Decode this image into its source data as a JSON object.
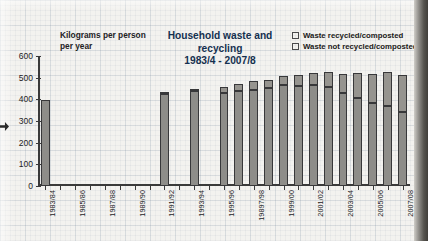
{
  "chart_data": {
    "type": "bar",
    "stacked": true,
    "title": "Household waste and recycling\n1983/4 - 2007/8",
    "title_line1": "Household waste and recycling",
    "title_line2": "1983/4 - 2007/8",
    "ylabel": "Kilograms per person per year",
    "ylabel_line1": "Kilograms per person",
    "ylabel_line2": "per year",
    "xlabel": "",
    "ylim": [
      0,
      600
    ],
    "yticks": [
      0,
      100,
      200,
      300,
      400,
      500,
      600
    ],
    "grid": true,
    "legend_position": "top-right",
    "categories": [
      "1983/84",
      "1984/85",
      "1985/86",
      "1986/87",
      "1987/88",
      "1988/89",
      "1989/90",
      "1990/91",
      "1991/92",
      "1992/93",
      "1993/94",
      "1994/95",
      "1995/96",
      "1996/97",
      "19897/98",
      "1998/99",
      "1999/00",
      "2000/01",
      "2001/02",
      "2002/03",
      "2003/04",
      "2004/05",
      "2005/06",
      "2006/07",
      "2007/08"
    ],
    "xtick_labels": [
      "1983/84",
      "1985/86",
      "1987/88",
      "1989/90",
      "1991/92",
      "1993/94",
      "1995/96",
      "19897/98",
      "1999/00",
      "2001/02",
      "2003/04",
      "2005/06",
      "2007/08"
    ],
    "series": [
      {
        "name": "Waste not recycled/composted",
        "color": "#8e8d89",
        "values": [
          397,
          null,
          null,
          null,
          null,
          null,
          null,
          null,
          424,
          null,
          437,
          null,
          427,
          440,
          443,
          452,
          464,
          463,
          464,
          455,
          428,
          408,
          384,
          367,
          343
        ]
      },
      {
        "name": "Waste recycled/composted",
        "color": "#96948f",
        "values": [
          0,
          null,
          null,
          null,
          null,
          null,
          null,
          null,
          7,
          null,
          11,
          null,
          28,
          33,
          41,
          38,
          44,
          49,
          56,
          70,
          87,
          112,
          131,
          157,
          171
        ]
      }
    ],
    "totals": [
      397,
      null,
      null,
      null,
      null,
      null,
      null,
      null,
      431,
      null,
      448,
      null,
      455,
      473,
      484,
      490,
      508,
      512,
      520,
      525,
      515,
      520,
      515,
      524,
      514
    ]
  },
  "legend": {
    "items": [
      {
        "label": "Waste recycled/composted"
      },
      {
        "label": "Waste not recycled/composted"
      }
    ]
  }
}
